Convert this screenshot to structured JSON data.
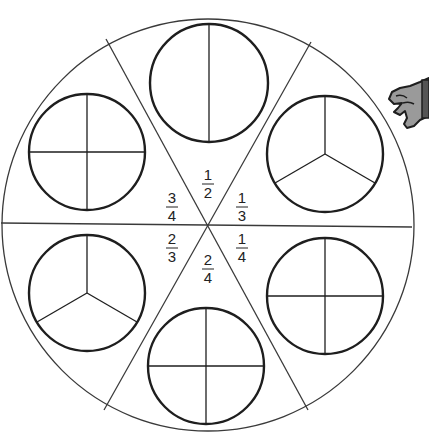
{
  "diagram": {
    "type": "fraction-wheel",
    "colors": {
      "line": "#3a3a3a",
      "thick": "#1e1e1e",
      "hand_fill": "#9a9a9a"
    },
    "center_labels": [
      {
        "id": "half",
        "num": "1",
        "den": "2",
        "x": 208,
        "y": 180
      },
      {
        "id": "third",
        "num": "1",
        "den": "3",
        "x": 242,
        "y": 203
      },
      {
        "id": "quarter",
        "num": "1",
        "den": "4",
        "x": 242,
        "y": 244
      },
      {
        "id": "two-quarters",
        "num": "2",
        "den": "4",
        "x": 208,
        "y": 265
      },
      {
        "id": "two-thirds",
        "num": "2",
        "den": "3",
        "x": 172,
        "y": 244
      },
      {
        "id": "three-quarters",
        "num": "3",
        "den": "4",
        "x": 172,
        "y": 203
      }
    ],
    "pie_circles": [
      {
        "id": "top",
        "divisions": "halves"
      },
      {
        "id": "upper-right",
        "divisions": "thirds"
      },
      {
        "id": "lower-right",
        "divisions": "quarters"
      },
      {
        "id": "bottom",
        "divisions": "quarters"
      },
      {
        "id": "lower-left",
        "divisions": "thirds"
      },
      {
        "id": "upper-left",
        "divisions": "quarters"
      }
    ]
  }
}
